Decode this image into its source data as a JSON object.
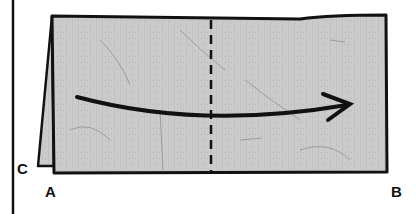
{
  "diagram": {
    "type": "origami-fold-step",
    "labels": {
      "corner_c": "C",
      "corner_a": "A",
      "corner_b": "B"
    },
    "elements": {
      "paper_color": "#c9c9c9",
      "outline_color": "#111111",
      "fold_line": "dashed vertical center valley fold",
      "arrow": "curved arrow from left to right across the paper"
    }
  }
}
